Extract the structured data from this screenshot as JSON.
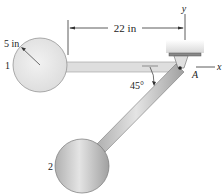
{
  "figure": {
    "labels": {
      "dimension_length": "22 in",
      "radius": "5 in",
      "angle": "45°",
      "pin": "A",
      "x_axis": "x",
      "y_axis": "y",
      "sphere_1": "1",
      "sphere_2": "2"
    },
    "colors": {
      "sphere_1_fill": "#e6e6e6",
      "sphere_2_fill": "#c8c8c8",
      "rod_fill": "#d9d9d9",
      "diag_rod_fill": "#a8a8a8",
      "support_fill": "#eeeeee",
      "line": "#333333"
    }
  }
}
